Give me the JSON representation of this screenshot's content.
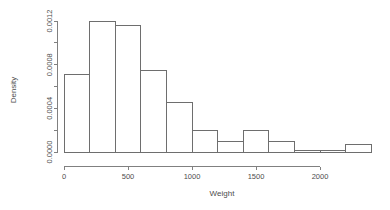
{
  "chart_data": {
    "type": "bar",
    "title": "",
    "subtitle": "",
    "xlabel": "Weight",
    "ylabel": "Density",
    "grid": false,
    "legend": "none",
    "bin_width": 200,
    "bin_edges": [
      0,
      200,
      400,
      600,
      800,
      1000,
      1200,
      1400,
      1600,
      1800,
      2000,
      2200,
      2400
    ],
    "categories": [
      "0-200",
      "200-400",
      "400-600",
      "600-800",
      "800-1000",
      "1000-1200",
      "1200-1400",
      "1400-1600",
      "1600-1800",
      "1800-2000",
      "2000-2200",
      "2200-2400"
    ],
    "values": [
      0.00071,
      0.0012,
      0.00116,
      0.00075,
      0.00045,
      0.0002,
      0.0001,
      0.0002,
      0.0001,
      1.5e-05,
      1.5e-05,
      7e-05
    ],
    "xlim": [
      0,
      2400
    ],
    "ylim": [
      0,
      0.00125
    ],
    "xticks": [
      0,
      500,
      1000,
      1500,
      2000
    ],
    "xtick_labels": [
      "0",
      "500",
      "1000",
      "1500",
      "2000"
    ],
    "yticks": [
      0.0,
      0.0002,
      0.0004,
      0.0006,
      0.0008,
      0.001,
      0.0012
    ],
    "ytick_labels": [
      "0.0000",
      "",
      "0.0004",
      "",
      "0.0008",
      "",
      "0.0012"
    ],
    "ylabeled_ticks": [
      {
        "value": 0.0,
        "label": "0.0000"
      },
      {
        "value": 0.0004,
        "label": "0.0004"
      },
      {
        "value": 0.0008,
        "label": "0.0008"
      },
      {
        "value": 0.0012,
        "label": "0.0012"
      }
    ],
    "axis_color": "#808080",
    "bar_stroke_color": "#6e6e6e",
    "bar_fill_color": "none",
    "text_color": "#4d4d4d"
  }
}
